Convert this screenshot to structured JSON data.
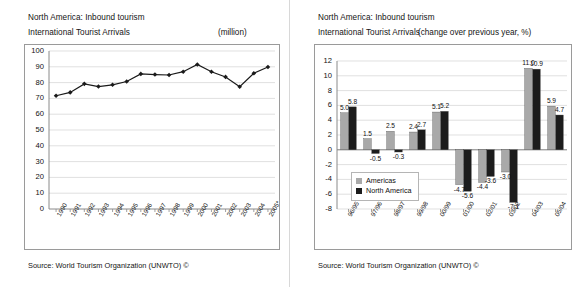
{
  "panels": {
    "left": {
      "title_line1": "North America: Inbound tourism",
      "title_line2": "International Tourist Arrivals",
      "unit": "(million)",
      "source": "Source: World Tourism Organization (UNWTO) ©"
    },
    "right": {
      "title_line1": "North America: Inbound tourism",
      "title_line2": "International Tourist Arrivals",
      "unit": "(change over previous year, %)",
      "source": "Source: World Tourism Organization (UNWTO) ©"
    }
  },
  "chart_data": [
    {
      "type": "line",
      "title": "North America: Inbound tourism — International Tourist Arrivals",
      "xlabel": "",
      "ylabel": "(million)",
      "ylim": [
        0,
        100
      ],
      "yticks": [
        0,
        10,
        20,
        30,
        40,
        50,
        60,
        70,
        80,
        90,
        100
      ],
      "grid": true,
      "legend": "none",
      "marker": "diamond",
      "series_color": "#1a1a1a",
      "categories": [
        "1990",
        "1991",
        "1992",
        "1993",
        "1994",
        "1995",
        "1996",
        "1997",
        "1998",
        "1999",
        "2000",
        "2001",
        "2002",
        "2003",
        "2004",
        "2005*"
      ],
      "values": [
        71.7,
        73.8,
        79.2,
        77.5,
        78.6,
        80.7,
        85.5,
        85.1,
        84.8,
        86.9,
        91.5,
        86.9,
        83.6,
        77.4,
        85.9,
        89.9
      ]
    },
    {
      "type": "bar",
      "title": "North America: Inbound tourism — International Tourist Arrivals",
      "xlabel": "",
      "ylabel": "(change over previous year, %)",
      "ylim": [
        -8,
        12
      ],
      "yticks": [
        -8,
        -6,
        -4,
        -2,
        0,
        2,
        4,
        6,
        8,
        10,
        12
      ],
      "grid": true,
      "legend": "inside-left",
      "categories": [
        "96/95",
        "97/96",
        "98/97",
        "99/98",
        "00/99",
        "01/00",
        "02/01",
        "03/02",
        "04/03",
        "05/04"
      ],
      "series": [
        {
          "name": "Americas",
          "color": "#a9a9a9",
          "values": [
            5.0,
            1.5,
            2.5,
            2.4,
            5.1,
            -4.7,
            -4.4,
            -3.0,
            11.0,
            5.9
          ]
        },
        {
          "name": "North America",
          "color": "#1c1c1c",
          "values": [
            5.8,
            -0.5,
            -0.3,
            2.7,
            5.2,
            -5.6,
            -3.6,
            -7.1,
            10.9,
            4.7
          ]
        }
      ],
      "data_labels": {
        "Americas": [
          "5.0",
          "1.5",
          "2.5",
          "2.4",
          "5.1",
          "-4.7",
          "-4.4",
          "-3.0",
          "11.0",
          "5.9"
        ],
        "North America": [
          "5.8",
          "-0.5",
          "-0.3",
          "2.7",
          "5.2",
          "-5.6",
          "-3.6",
          "-7.1",
          "10.9",
          "4.7"
        ]
      }
    }
  ]
}
